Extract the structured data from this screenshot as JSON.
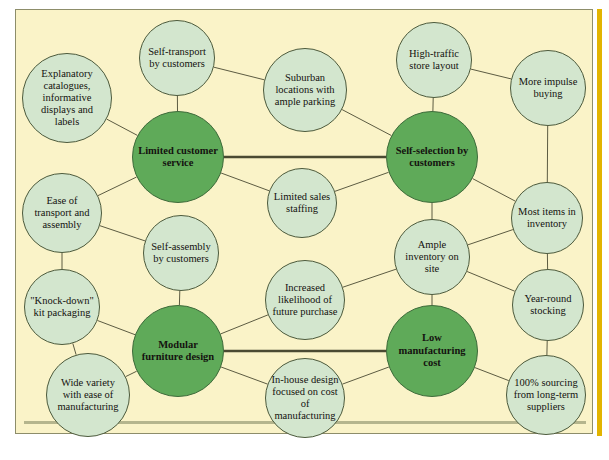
{
  "diagram": {
    "type": "network-cluster-diagram",
    "canvas": {
      "width": 609,
      "height": 460
    },
    "colors": {
      "background": "#faf3c8",
      "page": "#ffffff",
      "hub_fill": "#5faa59",
      "node_fill": "#d3e6ce",
      "node_stroke": "#4c5a3c",
      "link": "#4a4a32",
      "accent_bar": "#e2b400",
      "frame_border": "#8d8d6a"
    },
    "hubs": [
      {
        "id": "h1",
        "label": "Limited customer service",
        "cx": 178,
        "cy": 157,
        "r": 46
      },
      {
        "id": "h2",
        "label": "Self-selection by customers",
        "cx": 432,
        "cy": 157,
        "r": 46
      },
      {
        "id": "h3",
        "label": "Modular furniture design",
        "cx": 178,
        "cy": 351,
        "r": 46
      },
      {
        "id": "h4",
        "label": "Low manufacturing cost",
        "cx": 432,
        "cy": 351,
        "r": 46
      }
    ],
    "nodes": [
      {
        "id": "n1",
        "label": "Explanatory catalogues, informative displays and labels",
        "cx": 67,
        "cy": 98,
        "r": 45
      },
      {
        "id": "n2",
        "label": "Self-transport by customers",
        "cx": 177,
        "cy": 58,
        "r": 38
      },
      {
        "id": "n3",
        "label": "Suburban locations with ample parking",
        "cx": 305,
        "cy": 90,
        "r": 42
      },
      {
        "id": "n4",
        "label": "High-traffic store layout",
        "cx": 434,
        "cy": 60,
        "r": 38
      },
      {
        "id": "n5",
        "label": "More impulse buying",
        "cx": 548,
        "cy": 88,
        "r": 38
      },
      {
        "id": "n6",
        "label": "Ease of transport and assembly",
        "cx": 62,
        "cy": 213,
        "r": 40
      },
      {
        "id": "n7",
        "label": "Limited sales staffing",
        "cx": 302,
        "cy": 203,
        "r": 35
      },
      {
        "id": "n8",
        "label": "Most items in inventory",
        "cx": 547,
        "cy": 218,
        "r": 36
      },
      {
        "id": "n9",
        "label": "Self-assembly by customers",
        "cx": 181,
        "cy": 253,
        "r": 38
      },
      {
        "id": "n10",
        "label": "Ample inventory on site",
        "cx": 432,
        "cy": 257,
        "r": 38
      },
      {
        "id": "n11",
        "label": "\"Knock-down\" kit packaging",
        "cx": 62,
        "cy": 307,
        "r": 38
      },
      {
        "id": "n12",
        "label": "Increased likelihood of future purchase",
        "cx": 305,
        "cy": 300,
        "r": 40
      },
      {
        "id": "n13",
        "label": "Year-round stocking",
        "cx": 548,
        "cy": 305,
        "r": 36
      },
      {
        "id": "n14",
        "label": "Wide variety with ease of manufacturing",
        "cx": 88,
        "cy": 395,
        "r": 42
      },
      {
        "id": "n15",
        "label": "In-house design focused on cost of manufacturing",
        "cx": 305,
        "cy": 398,
        "r": 40
      },
      {
        "id": "n16",
        "label": "100% sourcing from long-term suppliers",
        "cx": 546,
        "cy": 395,
        "r": 40
      }
    ],
    "links": [
      {
        "from": "n1",
        "to": "h1",
        "weight": "thin"
      },
      {
        "from": "n2",
        "to": "h1",
        "weight": "thin"
      },
      {
        "from": "n2",
        "to": "n3",
        "weight": "thin"
      },
      {
        "from": "n3",
        "to": "h2",
        "weight": "thin"
      },
      {
        "from": "n4",
        "to": "h2",
        "weight": "thin"
      },
      {
        "from": "n4",
        "to": "n5",
        "weight": "thin"
      },
      {
        "from": "n5",
        "to": "n8",
        "weight": "thin"
      },
      {
        "from": "h1",
        "to": "n7",
        "weight": "thin"
      },
      {
        "from": "n7",
        "to": "h2",
        "weight": "thin"
      },
      {
        "from": "h1",
        "to": "h2",
        "weight": "thick"
      },
      {
        "from": "n6",
        "to": "h1",
        "weight": "thin"
      },
      {
        "from": "n6",
        "to": "n11",
        "weight": "thin"
      },
      {
        "from": "n6",
        "to": "n9",
        "weight": "thin"
      },
      {
        "from": "n9",
        "to": "h3",
        "weight": "thin"
      },
      {
        "from": "n11",
        "to": "h3",
        "weight": "thin"
      },
      {
        "from": "n11",
        "to": "n14",
        "weight": "thin"
      },
      {
        "from": "n14",
        "to": "h3",
        "weight": "thin"
      },
      {
        "from": "h3",
        "to": "n12",
        "weight": "thin"
      },
      {
        "from": "n12",
        "to": "n10",
        "weight": "thin"
      },
      {
        "from": "h3",
        "to": "n15",
        "weight": "thin"
      },
      {
        "from": "n15",
        "to": "h4",
        "weight": "thin"
      },
      {
        "from": "h3",
        "to": "h4",
        "weight": "thick"
      },
      {
        "from": "n10",
        "to": "h4",
        "weight": "thin"
      },
      {
        "from": "n10",
        "to": "n8",
        "weight": "thin"
      },
      {
        "from": "n10",
        "to": "n13",
        "weight": "thin"
      },
      {
        "from": "n8",
        "to": "n13",
        "weight": "thin"
      },
      {
        "from": "n13",
        "to": "n16",
        "weight": "thin"
      },
      {
        "from": "h4",
        "to": "n16",
        "weight": "thin"
      },
      {
        "from": "h2",
        "to": "n10",
        "weight": "thin"
      },
      {
        "from": "h2",
        "to": "n8",
        "weight": "thin"
      }
    ]
  }
}
